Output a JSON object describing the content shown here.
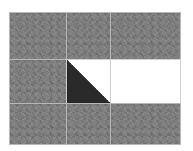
{
  "puzzle": {
    "type": "sliding-tile-puzzle",
    "grid": {
      "rows": 3,
      "cols": 3
    },
    "tiles": [
      {
        "row": 0,
        "col": 0,
        "kind": "noise"
      },
      {
        "row": 0,
        "col": 1,
        "kind": "noise"
      },
      {
        "row": 0,
        "col": 2,
        "kind": "noise"
      },
      {
        "row": 1,
        "col": 0,
        "kind": "noise"
      },
      {
        "row": 1,
        "col": 1,
        "kind": "triangle"
      },
      {
        "row": 1,
        "col": 2,
        "kind": "blank"
      },
      {
        "row": 2,
        "col": 0,
        "kind": "noise"
      },
      {
        "row": 2,
        "col": 1,
        "kind": "noise"
      },
      {
        "row": 2,
        "col": 2,
        "kind": "noise"
      }
    ],
    "colors": {
      "noise": "#808080",
      "blank": "#ffffff",
      "triangle": "#2a2a2a",
      "grid_line": "#b8b8b8"
    }
  }
}
